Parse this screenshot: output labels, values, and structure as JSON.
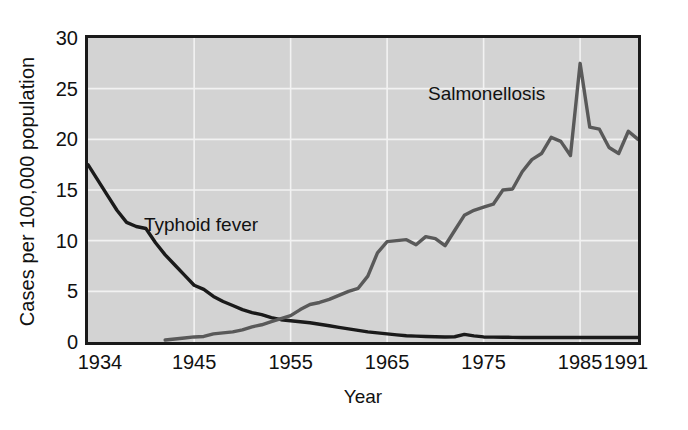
{
  "chart_data": {
    "type": "line",
    "title": "",
    "subtitle": "",
    "xlabel": "Year",
    "ylabel": "Cases per 100,000 population",
    "xlim": [
      1934,
      1991
    ],
    "ylim": [
      0,
      30
    ],
    "yticks": [
      0,
      5,
      10,
      15,
      20,
      25,
      30
    ],
    "xticks": [
      1934,
      1945,
      1955,
      1965,
      1975,
      1985,
      1991
    ],
    "grid": true,
    "grid_color": "#f2f2f2",
    "plot_background": "#d3d3d3",
    "legend": "inline-annotations",
    "annotations": [
      {
        "text": "Typhoid fever",
        "x": 1941,
        "y": 9.5
      },
      {
        "text": "Salmonellosis",
        "x": 1971,
        "y": 22.5
      }
    ],
    "series": [
      {
        "name": "Typhoid fever",
        "color": "#1a1a1a",
        "x": [
          1934,
          1935,
          1936,
          1937,
          1938,
          1939,
          1940,
          1941,
          1942,
          1943,
          1944,
          1945,
          1946,
          1947,
          1948,
          1949,
          1950,
          1951,
          1952,
          1953,
          1954,
          1955,
          1956,
          1957,
          1958,
          1959,
          1960,
          1961,
          1962,
          1963,
          1964,
          1965,
          1966,
          1967,
          1968,
          1969,
          1970,
          1971,
          1972,
          1973,
          1974,
          1975,
          1976,
          1977,
          1978,
          1979,
          1980,
          1981,
          1982,
          1983,
          1984,
          1985,
          1986,
          1987,
          1988,
          1989,
          1990,
          1991
        ],
        "y": [
          17.5,
          16.0,
          14.5,
          13.0,
          11.8,
          11.4,
          11.2,
          9.8,
          8.6,
          7.6,
          6.6,
          5.6,
          5.2,
          4.5,
          4.0,
          3.6,
          3.2,
          2.9,
          2.7,
          2.4,
          2.2,
          2.1,
          2.0,
          1.9,
          1.75,
          1.6,
          1.45,
          1.3,
          1.15,
          1.0,
          0.9,
          0.8,
          0.7,
          0.62,
          0.58,
          0.55,
          0.52,
          0.5,
          0.52,
          0.75,
          0.6,
          0.5,
          0.48,
          0.47,
          0.46,
          0.45,
          0.45,
          0.45,
          0.45,
          0.45,
          0.45,
          0.45,
          0.45,
          0.45,
          0.45,
          0.45,
          0.45,
          0.45
        ]
      },
      {
        "name": "Salmonellosis",
        "color": "#595959",
        "x": [
          1942,
          1943,
          1944,
          1945,
          1946,
          1947,
          1948,
          1949,
          1950,
          1951,
          1952,
          1953,
          1954,
          1955,
          1956,
          1957,
          1958,
          1959,
          1960,
          1961,
          1962,
          1963,
          1964,
          1965,
          1966,
          1967,
          1968,
          1969,
          1970,
          1971,
          1972,
          1973,
          1974,
          1975,
          1976,
          1977,
          1978,
          1979,
          1980,
          1981,
          1982,
          1983,
          1984,
          1985,
          1986,
          1987,
          1988,
          1989,
          1990,
          1991
        ],
        "y": [
          0.2,
          0.3,
          0.4,
          0.5,
          0.55,
          0.8,
          0.9,
          1.0,
          1.2,
          1.5,
          1.7,
          2.0,
          2.3,
          2.6,
          3.2,
          3.7,
          3.9,
          4.2,
          4.6,
          5.0,
          5.3,
          6.5,
          8.8,
          9.9,
          10.0,
          10.1,
          9.6,
          10.4,
          10.2,
          9.5,
          11.0,
          12.5,
          13.0,
          13.3,
          13.6,
          15.0,
          15.1,
          16.8,
          18.0,
          18.6,
          20.2,
          19.8,
          18.4,
          27.5,
          21.2,
          21.0,
          19.2,
          18.6,
          20.8,
          20.0
        ]
      }
    ]
  },
  "axis": {
    "y_title": "Cases per 100,000 population",
    "x_title": "Year",
    "y_tick_labels": [
      "30",
      "25",
      "20",
      "15",
      "10",
      "5",
      "0"
    ],
    "x_tick_labels": [
      "1934",
      "1945",
      "1955",
      "1965",
      "1975",
      "1985",
      "1991"
    ]
  },
  "labels": {
    "typhoid": "Typhoid fever",
    "salmonellosis": "Salmonellosis"
  }
}
